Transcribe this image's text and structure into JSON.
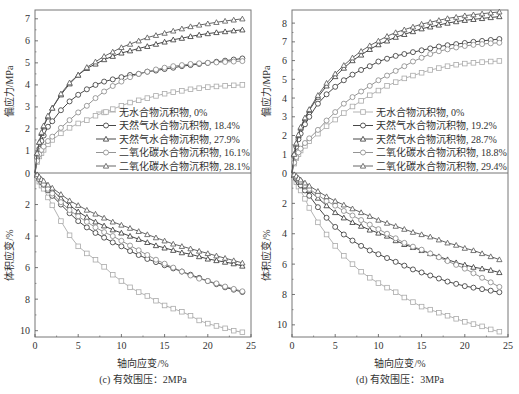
{
  "chart_data": [
    {
      "type": "line",
      "panel": "left",
      "caption": "(c) 有效围压：2MPa",
      "xlabel": "轴向应变/%",
      "ylabel_top": "偏应力/MPa",
      "ylabel_bottom": "体积应变/%",
      "xlim": [
        0,
        25
      ],
      "xticks": [
        "0",
        "5",
        "10",
        "15",
        "20",
        "25"
      ],
      "ylim_top": [
        0,
        7.4
      ],
      "yticks_top": [
        "0",
        "1",
        "2",
        "3",
        "4",
        "5",
        "6",
        "7"
      ],
      "ylim_bottom": [
        0,
        10.4
      ],
      "yticks_bottom": [
        "0",
        "2",
        "4",
        "6",
        "8",
        "10"
      ],
      "legend_position": "center-right",
      "x": [
        0,
        0.25,
        0.5,
        0.75,
        1,
        1.5,
        2,
        3,
        4,
        5,
        6,
        7,
        8,
        9,
        10,
        11,
        12,
        13,
        14,
        15,
        16,
        17,
        18,
        19,
        20,
        21,
        22,
        23,
        24
      ],
      "series": [
        {
          "name": "无水合物沉积物, 0%",
          "marker": "square",
          "color": "#aaaaaa",
          "stress": [
            0,
            0.5,
            0.75,
            0.9,
            1.05,
            1.3,
            1.5,
            1.8,
            2.05,
            2.25,
            2.4,
            2.6,
            2.75,
            2.9,
            3.05,
            3.2,
            3.3,
            3.4,
            3.5,
            3.6,
            3.67,
            3.73,
            3.8,
            3.85,
            3.9,
            3.93,
            3.96,
            3.98,
            4.0
          ],
          "volumetric": [
            0,
            0.3,
            0.55,
            0.8,
            1.0,
            1.55,
            2.05,
            3.05,
            3.95,
            4.65,
            5.1,
            5.5,
            5.95,
            6.45,
            6.85,
            7.25,
            7.55,
            7.8,
            8.1,
            8.4,
            8.6,
            8.8,
            9.05,
            9.35,
            9.55,
            9.7,
            9.85,
            10.0,
            10.1
          ]
        },
        {
          "name": "天然气水合物沉积物, 18.4%",
          "marker": "circle",
          "color": "#333333",
          "stress": [
            0,
            0.7,
            1.1,
            1.45,
            1.7,
            2.1,
            2.35,
            2.85,
            3.25,
            3.55,
            3.8,
            4.0,
            4.15,
            4.25,
            4.35,
            4.45,
            4.5,
            4.6,
            4.65,
            4.72,
            4.78,
            4.85,
            4.9,
            4.95,
            5.0,
            5.05,
            5.1,
            5.15,
            5.2
          ],
          "volumetric": [
            0,
            0.2,
            0.4,
            0.6,
            0.75,
            1.1,
            1.45,
            2.0,
            2.55,
            3.05,
            3.45,
            3.8,
            4.1,
            4.4,
            4.65,
            4.95,
            5.2,
            5.45,
            5.65,
            5.85,
            6.05,
            6.25,
            6.45,
            6.65,
            6.85,
            7.05,
            7.25,
            7.4,
            7.55
          ]
        },
        {
          "name": "天然气水合物沉积物, 27.9%",
          "marker": "triangle",
          "color": "#333333",
          "stress": [
            0,
            0.9,
            1.4,
            1.8,
            2.1,
            2.55,
            2.95,
            3.55,
            4.05,
            4.45,
            4.75,
            4.95,
            5.15,
            5.3,
            5.45,
            5.55,
            5.65,
            5.75,
            5.85,
            5.95,
            6.05,
            6.12,
            6.2,
            6.27,
            6.33,
            6.38,
            6.42,
            6.46,
            6.5
          ],
          "volumetric": [
            0,
            0.15,
            0.3,
            0.45,
            0.6,
            0.85,
            1.1,
            1.6,
            2.05,
            2.45,
            2.8,
            3.1,
            3.35,
            3.6,
            3.8,
            4.0,
            4.2,
            4.4,
            4.6,
            4.75,
            4.9,
            5.05,
            5.15,
            5.3,
            5.45,
            5.55,
            5.65,
            5.75,
            5.9
          ]
        },
        {
          "name": "二氧化碳水合物沉积物, 16.1%",
          "marker": "circle",
          "color": "#888888",
          "stress": [
            0,
            0.55,
            0.85,
            1.05,
            1.2,
            1.45,
            1.65,
            2.05,
            2.4,
            2.75,
            3.05,
            3.4,
            3.7,
            3.95,
            4.15,
            4.35,
            4.5,
            4.6,
            4.7,
            4.78,
            4.85,
            4.9,
            4.95,
            4.98,
            5.0,
            5.02,
            5.04,
            5.06,
            5.08
          ],
          "volumetric": [
            0,
            0.2,
            0.4,
            0.55,
            0.7,
            1.0,
            1.3,
            1.85,
            2.35,
            2.75,
            3.1,
            3.45,
            3.75,
            4.0,
            4.3,
            4.6,
            4.9,
            5.2,
            5.5,
            5.75,
            6.0,
            6.25,
            6.5,
            6.7,
            6.85,
            7.0,
            7.2,
            7.35,
            7.5
          ]
        },
        {
          "name": "二氧化碳水合物沉积物, 28.1%",
          "marker": "triangle",
          "color": "#555555",
          "stress": [
            0,
            0.9,
            1.4,
            1.85,
            2.15,
            2.6,
            2.95,
            3.6,
            4.1,
            4.45,
            4.8,
            5.05,
            5.3,
            5.5,
            5.7,
            5.85,
            6.0,
            6.15,
            6.25,
            6.35,
            6.45,
            6.55,
            6.65,
            6.72,
            6.78,
            6.84,
            6.9,
            6.95,
            7.0
          ],
          "volumetric": [
            0,
            0.1,
            0.25,
            0.4,
            0.5,
            0.75,
            0.95,
            1.35,
            1.75,
            2.05,
            2.35,
            2.6,
            2.85,
            3.1,
            3.3,
            3.5,
            3.7,
            3.9,
            4.1,
            4.3,
            4.5,
            4.65,
            4.8,
            4.95,
            5.1,
            5.25,
            5.4,
            5.55,
            5.7
          ]
        }
      ]
    },
    {
      "type": "line",
      "panel": "right",
      "caption": "(d) 有效围压：3MPa",
      "xlabel": "轴向应变/%",
      "ylabel_top": "偏应力/MPa",
      "ylabel_bottom": "体积应变/%",
      "xlim": [
        0,
        25
      ],
      "xticks": [
        "0",
        "5",
        "10",
        "15",
        "20",
        "25"
      ],
      "ylim_top": [
        0,
        8.7
      ],
      "yticks_top": [
        "0",
        "1",
        "2",
        "3",
        "4",
        "5",
        "6",
        "7",
        "8"
      ],
      "ylim_bottom": [
        0,
        10.8
      ],
      "yticks_bottom": [
        "0",
        "2",
        "4",
        "6",
        "8",
        "10"
      ],
      "legend_position": "center-right",
      "x": [
        0,
        0.25,
        0.5,
        0.75,
        1,
        1.5,
        2,
        3,
        4,
        5,
        6,
        7,
        8,
        9,
        10,
        11,
        12,
        13,
        14,
        15,
        16,
        17,
        18,
        19,
        20,
        21,
        22,
        23,
        24
      ],
      "series": [
        {
          "name": "无水合物沉积物, 0%",
          "marker": "square",
          "color": "#aaaaaa",
          "stress": [
            0,
            0.5,
            0.8,
            1.0,
            1.2,
            1.45,
            1.7,
            2.1,
            2.5,
            2.85,
            3.2,
            3.55,
            3.85,
            4.15,
            4.4,
            4.65,
            4.85,
            5.05,
            5.2,
            5.35,
            5.5,
            5.6,
            5.7,
            5.78,
            5.84,
            5.88,
            5.92,
            5.95,
            5.98
          ],
          "volumetric": [
            0,
            0.3,
            0.6,
            0.9,
            1.15,
            1.7,
            2.3,
            3.25,
            4.05,
            4.8,
            5.45,
            6.0,
            6.5,
            6.9,
            7.25,
            7.55,
            7.85,
            8.2,
            8.5,
            8.8,
            9.0,
            9.2,
            9.4,
            9.6,
            9.8,
            9.95,
            10.1,
            10.3,
            10.45
          ]
        },
        {
          "name": "天然气水合物沉积物, 19.2%",
          "marker": "circle",
          "color": "#333333",
          "stress": [
            0,
            0.9,
            1.4,
            1.8,
            2.1,
            2.6,
            3.0,
            3.7,
            4.2,
            4.6,
            4.95,
            5.25,
            5.5,
            5.7,
            5.95,
            6.1,
            6.25,
            6.35,
            6.45,
            6.55,
            6.65,
            6.75,
            6.82,
            6.88,
            6.94,
            7.0,
            7.05,
            7.1,
            7.15
          ],
          "volumetric": [
            0,
            0.2,
            0.4,
            0.6,
            0.8,
            1.15,
            1.5,
            2.25,
            2.95,
            3.55,
            4.05,
            4.45,
            4.8,
            5.1,
            5.35,
            5.6,
            5.85,
            6.1,
            6.35,
            6.55,
            6.75,
            6.95,
            7.15,
            7.3,
            7.45,
            7.55,
            7.65,
            7.75,
            7.85
          ]
        },
        {
          "name": "天然气水合物沉积物, 28.7%",
          "marker": "triangle",
          "color": "#333333",
          "stress": [
            0,
            1.0,
            1.55,
            2.0,
            2.4,
            2.9,
            3.35,
            4.05,
            4.65,
            5.15,
            5.6,
            6.0,
            6.3,
            6.6,
            6.85,
            7.05,
            7.25,
            7.4,
            7.55,
            7.7,
            7.8,
            7.9,
            8.0,
            8.08,
            8.15,
            8.2,
            8.25,
            8.3,
            8.35
          ],
          "volumetric": [
            0,
            0.15,
            0.3,
            0.45,
            0.6,
            0.9,
            1.15,
            1.65,
            2.15,
            2.6,
            2.95,
            3.25,
            3.5,
            3.75,
            3.95,
            4.15,
            4.45,
            4.7,
            4.9,
            5.1,
            5.3,
            5.5,
            5.7,
            5.9,
            6.05,
            6.2,
            6.3,
            6.4,
            6.55
          ]
        },
        {
          "name": "二氧化碳水合物沉积物, 18.8%",
          "marker": "circle",
          "color": "#888888",
          "stress": [
            0,
            0.55,
            0.85,
            1.1,
            1.3,
            1.6,
            1.85,
            2.3,
            2.8,
            3.25,
            3.7,
            4.05,
            4.35,
            4.65,
            4.95,
            5.2,
            5.45,
            5.7,
            5.95,
            6.15,
            6.35,
            6.5,
            6.6,
            6.7,
            6.78,
            6.84,
            6.88,
            6.92,
            6.95
          ],
          "volumetric": [
            0,
            0.15,
            0.3,
            0.45,
            0.55,
            0.8,
            1.05,
            1.45,
            1.85,
            2.15,
            2.5,
            2.8,
            3.1,
            3.4,
            3.7,
            4.0,
            4.3,
            4.6,
            4.85,
            5.05,
            5.3,
            5.55,
            5.8,
            6.05,
            6.3,
            6.6,
            6.9,
            7.2,
            7.5
          ]
        },
        {
          "name": "二氧化碳水合物沉积物, 29.4%",
          "marker": "triangle",
          "color": "#555555",
          "stress": [
            0,
            1.0,
            1.6,
            2.05,
            2.45,
            2.95,
            3.4,
            4.15,
            4.8,
            5.3,
            5.75,
            6.15,
            6.5,
            6.8,
            7.05,
            7.3,
            7.5,
            7.65,
            7.8,
            7.95,
            8.05,
            8.15,
            8.25,
            8.32,
            8.4,
            8.45,
            8.5,
            8.55,
            8.6
          ],
          "volumetric": [
            0,
            0.1,
            0.2,
            0.35,
            0.45,
            0.65,
            0.85,
            1.2,
            1.55,
            1.85,
            2.1,
            2.35,
            2.6,
            2.85,
            3.1,
            3.3,
            3.5,
            3.7,
            3.9,
            4.05,
            4.2,
            4.4,
            4.6,
            4.75,
            4.95,
            5.1,
            5.3,
            5.5,
            5.7
          ]
        }
      ]
    }
  ]
}
